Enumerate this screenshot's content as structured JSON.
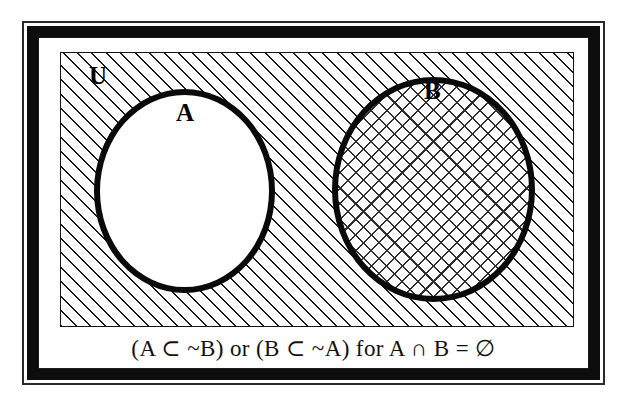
{
  "figure": {
    "type": "venn-diagram",
    "title_text": "",
    "caption": "(A ⊂ ~B) or (B ⊂ ~A) for A ∩ B = ∅",
    "background_color": "#ffffff",
    "ink_color": "#0a0a0a"
  },
  "frame": {
    "style": "ornate-double-border",
    "outer_line_color": "#2a2a2a",
    "thick_band_color": "#0d0d0d",
    "inner_line_color": "#1a1a1a"
  },
  "universe": {
    "label": "U",
    "fill": "diagonal-hatch",
    "fill_color": "#1a1a1a",
    "border_color": "#141414",
    "description": "universal set rectangle, hatched (shaded region)"
  },
  "sets": [
    {
      "label": "A",
      "fill": "none",
      "fill_color": "#ffffff",
      "outline_color": "#0a0a0a",
      "shape": "ellipse",
      "shaded": "false"
    },
    {
      "label": "B",
      "fill": "cross-hatch",
      "fill_color": "#2e2e2e",
      "outline_color": "#0a0a0a",
      "shape": "ellipse",
      "shaded": "true"
    }
  ],
  "relations": {
    "expression_1": "(A ⊂ ~B)",
    "connector": "or",
    "expression_2": "(B ⊂ ~A)",
    "condition_prefix": "for",
    "condition": "A ∩ B = ∅"
  }
}
